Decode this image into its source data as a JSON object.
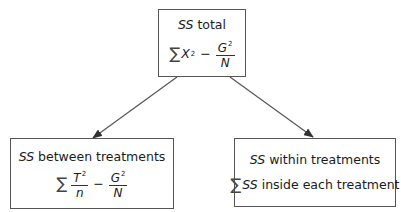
{
  "nodes": {
    "total": {
      "title_italic": "SS",
      "title_rest": " total",
      "formula": {
        "sigma": "∑",
        "term": "X",
        "term_sup": "2",
        "minus": "−",
        "frac_num": "G",
        "frac_num_sup": "2",
        "frac_den": "N"
      }
    },
    "between": {
      "title_italic": "SS",
      "title_rest": " between treatments",
      "formula": {
        "sigma": "∑",
        "frac1_num": "T",
        "frac1_num_sup": "2",
        "frac1_den": "n",
        "minus": "−",
        "frac2_num": "G",
        "frac2_num_sup": "2",
        "frac2_den": "N"
      }
    },
    "within": {
      "title_italic": "SS",
      "title_rest": " within treatments",
      "formula": {
        "sigma": "∑",
        "term_italic": "SS",
        "rest": " inside each treatment"
      }
    }
  },
  "edges": [
    {
      "from": "total",
      "to": "between"
    },
    {
      "from": "total",
      "to": "within"
    }
  ],
  "colors": {
    "line": "#555555",
    "text": "#1a1a1a"
  }
}
